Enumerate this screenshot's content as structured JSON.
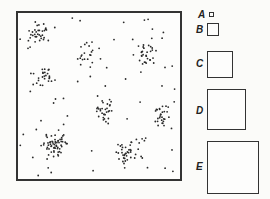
{
  "figure": {
    "clusters": [
      {
        "id": "c1",
        "cx": 0.12,
        "cy": 0.12,
        "spread": 0.07,
        "n": 35
      },
      {
        "id": "c2",
        "cx": 0.43,
        "cy": 0.25,
        "spread": 0.06,
        "n": 22
      },
      {
        "id": "c3",
        "cx": 0.78,
        "cy": 0.24,
        "spread": 0.06,
        "n": 30
      },
      {
        "id": "c4",
        "cx": 0.17,
        "cy": 0.4,
        "spread": 0.06,
        "n": 25
      },
      {
        "id": "c5",
        "cx": 0.53,
        "cy": 0.58,
        "spread": 0.06,
        "n": 30
      },
      {
        "id": "c6",
        "cx": 0.91,
        "cy": 0.61,
        "spread": 0.06,
        "n": 30
      },
      {
        "id": "c7",
        "cx": 0.23,
        "cy": 0.79,
        "spread": 0.06,
        "n": 60
      },
      {
        "id": "c8",
        "cx": 0.68,
        "cy": 0.84,
        "spread": 0.07,
        "n": 40
      }
    ],
    "background_points": 55,
    "windows": [
      {
        "label": "A",
        "relative_size": 1
      },
      {
        "label": "B",
        "relative_size": 2.75
      },
      {
        "label": "C",
        "relative_size": 6.5
      },
      {
        "label": "D",
        "relative_size": 9.75
      },
      {
        "label": "E",
        "relative_size": 13
      }
    ]
  }
}
